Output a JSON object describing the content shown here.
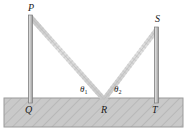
{
  "figure": {
    "type": "geometry-diagram",
    "background_color": "#ffffff",
    "ground": {
      "fill_color": "#c9c9c9",
      "edge_color": "#9a9a9a",
      "hatch_color": "#b4b4b4",
      "hatch_pattern": "diagonal"
    },
    "pole_color": "#b0b0b0",
    "pole_edge_color": "#8a8a8a",
    "rope_color": "#d2d2d2",
    "rope_edge_color": "#bdbdbd",
    "labels": {
      "pole_left_top": "P",
      "pole_left_base": "Q",
      "rope_vertex": "R",
      "pole_right_top": "S",
      "pole_right_base": "T"
    },
    "angles": {
      "left": {
        "symbol": "θ",
        "subscript": "1"
      },
      "right": {
        "symbol": "θ",
        "subscript": "2"
      }
    }
  }
}
